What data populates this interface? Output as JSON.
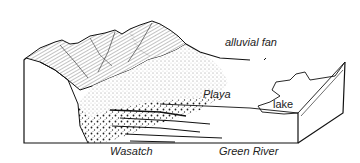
{
  "figure": {
    "type": "block-diagram",
    "labels": {
      "alluvial_fan": "alluvial fan",
      "playa": "Playa",
      "lake": "lake",
      "wasatch": "Wasatch",
      "green_river": "Green River"
    },
    "colors": {
      "ink": "#1a1a1a",
      "background": "#ffffff"
    }
  }
}
